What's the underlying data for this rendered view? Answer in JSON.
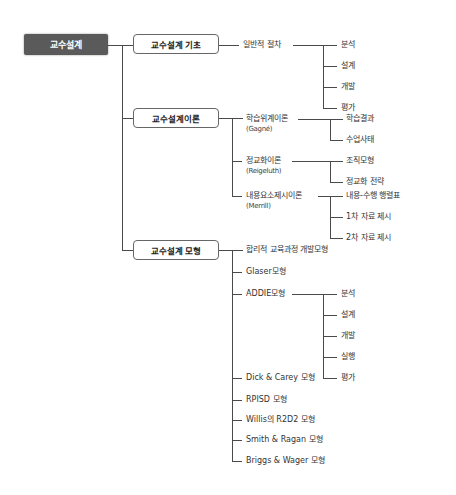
{
  "root": {
    "label": "교수설계"
  },
  "basics": {
    "label": "교수설계 기초",
    "procedure": {
      "label": "일반적 절차",
      "steps": [
        "분석",
        "설계",
        "개발",
        "평가"
      ]
    }
  },
  "theory": {
    "label": "교수설계이론",
    "items": [
      {
        "label": "학습위계이론",
        "author": "(Gagné)",
        "children": [
          "학습결과",
          "수업사태"
        ]
      },
      {
        "label": "정교화이론",
        "author": "(Reigeluth)",
        "children": [
          "조직모형",
          "정교화 전략"
        ]
      },
      {
        "label": "내용요소제시이론",
        "author": "(Merrill)",
        "children": [
          "내용-수행 행렬표",
          "1차 자료 제시",
          "2차 자료 제시"
        ]
      }
    ]
  },
  "models": {
    "label": "교수설계 모형",
    "items": [
      "합리적 교육과정 개발모형",
      "Glaser모형",
      "ADDIE모형",
      "Dick & Carey 모형",
      "RPISD 모형",
      "Willis의 R2D2 모형",
      "Smith & Ragan 모형",
      "Briggs & Wager 모형"
    ],
    "addie_steps": [
      "분석",
      "설계",
      "개발",
      "실행",
      "평가"
    ]
  },
  "colors": {
    "root_bg": "#5a5a5a",
    "line": "#4a4a4a",
    "box_border": "#666666"
  }
}
